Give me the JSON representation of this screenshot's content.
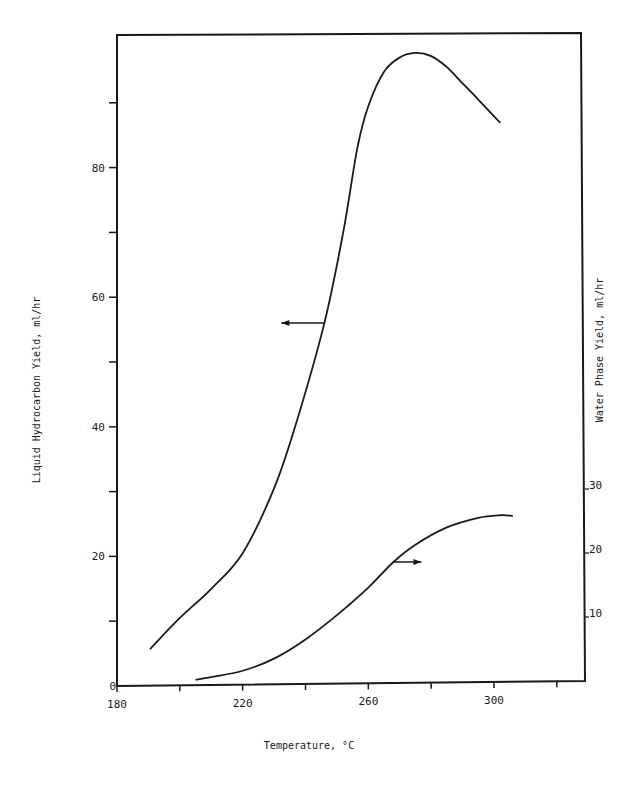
{
  "chart_data": {
    "type": "line",
    "title": "",
    "xlabel": "Temperature, °C",
    "ylabel": "Liquid Hydrocarbon Yield, ml/hr",
    "y2label": "Water Phase Yield, ml/hr",
    "xlim": [
      180,
      329
    ],
    "ylim": [
      0,
      100
    ],
    "y2lim": [
      0,
      30
    ],
    "x_ticks": [
      180,
      200,
      220,
      240,
      260,
      280,
      300,
      320
    ],
    "x_tick_labels": [
      "180",
      "",
      "220",
      "",
      "260",
      "",
      "300",
      ""
    ],
    "y_ticks": [
      0,
      10,
      20,
      30,
      40,
      50,
      60,
      70,
      80,
      90
    ],
    "y_tick_labels": [
      "0",
      "",
      "20",
      "",
      "40",
      "",
      "60",
      "",
      "80",
      ""
    ],
    "y2_ticks": [
      10,
      20,
      30
    ],
    "y2_tick_labels": [
      "10",
      "20",
      "30"
    ],
    "grid": false,
    "legend": "none (arrows indicate axis for each curve)",
    "series": [
      {
        "name": "Liquid Hydrocarbon Yield",
        "axis": "left",
        "x": [
          190.5,
          200,
          210,
          220,
          230,
          237,
          246,
          252,
          256.5,
          260,
          265,
          270,
          275,
          280,
          285,
          290,
          295,
          302
        ],
        "y": [
          5.7,
          10.5,
          15.0,
          20.5,
          30.5,
          40.5,
          56.0,
          70.0,
          83.0,
          89.5,
          94.8,
          97.0,
          97.7,
          97.2,
          95.5,
          93.0,
          90.5,
          86.9
        ]
      },
      {
        "name": "Water Phase Yield",
        "axis": "right",
        "x": [
          205,
          210,
          220,
          230,
          240,
          250,
          260,
          268,
          275,
          285,
          295,
          302,
          306
        ],
        "y": [
          0.2,
          0.6,
          1.6,
          3.5,
          6.5,
          10.3,
          14.6,
          18.6,
          21.3,
          24.0,
          25.5,
          25.9,
          25.8
        ]
      }
    ],
    "annotations": [
      {
        "type": "arrow",
        "direction": "left",
        "at_series": "Liquid Hydrocarbon Yield",
        "x": 246,
        "y": 56
      },
      {
        "type": "arrow",
        "direction": "right",
        "at_series": "Water Phase Yield",
        "x": 268,
        "y": 18.6
      }
    ]
  },
  "colors": {
    "ink": "#1a1a1a",
    "background": "#ffffff"
  }
}
